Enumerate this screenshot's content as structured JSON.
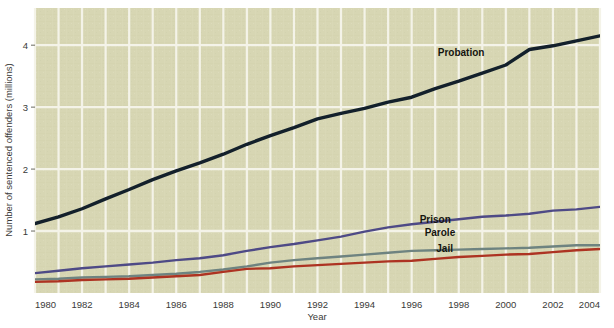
{
  "chart_data": {
    "type": "line",
    "title": "",
    "subtitle": "",
    "xlabel": "Year",
    "ylabel": "Number of sentenced offenders (millions)",
    "xlim": [
      1980,
      2004
    ],
    "ylim": [
      0,
      4.6
    ],
    "xticks": [
      1980,
      1982,
      1984,
      1986,
      1988,
      1990,
      1992,
      1994,
      1996,
      1998,
      2000,
      2002,
      2004
    ],
    "yticks": [
      1,
      2,
      3,
      4
    ],
    "xticklabels": [
      "1980",
      "1982",
      "1984",
      "1986",
      "1988",
      "1990",
      "1992",
      "1994",
      "1996",
      "1998",
      "2000",
      "2002",
      "2004"
    ],
    "yticklabels": [
      "1",
      "2",
      "3",
      "4"
    ],
    "grid": "both-white-on-khaki",
    "gridline_years_minor": [
      1981,
      1983,
      1985,
      1987,
      1989,
      1991,
      1993,
      1995,
      1997,
      1999,
      2001,
      2003
    ],
    "legend": "inline-labels",
    "plot_background": "#d7d6b3",
    "gridline_color": "#f4f3e8",
    "x": [
      1980,
      1981,
      1982,
      1983,
      1984,
      1985,
      1986,
      1987,
      1988,
      1989,
      1990,
      1991,
      1992,
      1993,
      1994,
      1995,
      1996,
      1997,
      1998,
      1999,
      2000,
      2001,
      2002,
      2003,
      2004
    ],
    "series": [
      {
        "name": "Probation",
        "color": "#13202b",
        "label_x": 1998.1,
        "label_y": 3.82,
        "values": [
          1.12,
          1.23,
          1.36,
          1.52,
          1.67,
          1.83,
          1.97,
          2.1,
          2.24,
          2.4,
          2.54,
          2.67,
          2.81,
          2.9,
          2.98,
          3.08,
          3.16,
          3.3,
          3.42,
          3.55,
          3.68,
          3.93,
          3.99,
          4.07,
          4.15
        ]
      },
      {
        "name": "Prison",
        "color": "#4e4a86",
        "label_x": 1997.0,
        "label_y": 1.13,
        "values": [
          0.32,
          0.36,
          0.4,
          0.43,
          0.46,
          0.49,
          0.53,
          0.56,
          0.61,
          0.68,
          0.74,
          0.79,
          0.85,
          0.91,
          0.99,
          1.06,
          1.11,
          1.15,
          1.19,
          1.23,
          1.25,
          1.28,
          1.33,
          1.35,
          1.39
        ]
      },
      {
        "name": "Parole",
        "color": "#6e8380",
        "label_x": 1997.2,
        "label_y": 0.92,
        "values": [
          0.22,
          0.23,
          0.25,
          0.26,
          0.27,
          0.29,
          0.31,
          0.34,
          0.38,
          0.43,
          0.49,
          0.53,
          0.56,
          0.59,
          0.62,
          0.65,
          0.68,
          0.69,
          0.7,
          0.71,
          0.72,
          0.73,
          0.75,
          0.77,
          0.77
        ]
      },
      {
        "name": "Jail",
        "color": "#ad3322",
        "label_x": 1997.4,
        "label_y": 0.66,
        "values": [
          0.18,
          0.19,
          0.21,
          0.22,
          0.23,
          0.25,
          0.27,
          0.29,
          0.34,
          0.39,
          0.4,
          0.43,
          0.45,
          0.47,
          0.49,
          0.51,
          0.52,
          0.55,
          0.58,
          0.6,
          0.62,
          0.63,
          0.66,
          0.69,
          0.71
        ]
      }
    ]
  },
  "axes": {
    "x_title": "Year",
    "y_title": "Number of sentenced offenders (millions)"
  }
}
